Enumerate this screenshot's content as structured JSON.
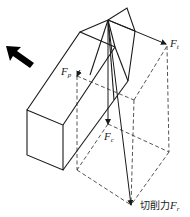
{
  "diagram": {
    "title": "",
    "feed_direction_arrow": {
      "direction": "up-left",
      "color": "#000000"
    },
    "forces": {
      "Ft": {
        "label": "F",
        "subscript": "t"
      },
      "Fp": {
        "label": "F",
        "subscript": "p"
      },
      "Fc": {
        "label": "F",
        "subscript": "c"
      },
      "Fr": {
        "prefix": "切削力",
        "label": "F",
        "subscript": "r"
      }
    },
    "colors": {
      "line": "#1a1a1a",
      "background": "#ffffff"
    }
  }
}
